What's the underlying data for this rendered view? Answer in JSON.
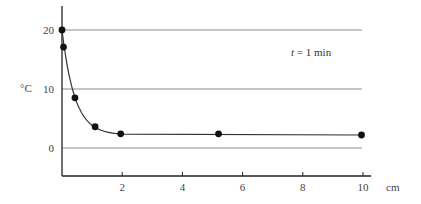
{
  "chart_data": {
    "type": "line",
    "title": "",
    "annotation": "t = 1 min",
    "annotation_italic": "t",
    "annotation_rest": " = 1 min",
    "xlabel": "cm",
    "ylabel": "°C",
    "xlim": [
      0,
      10
    ],
    "ylim": [
      -5,
      24
    ],
    "x_ticks": [
      2,
      4,
      6,
      8,
      10
    ],
    "y_ticks": [
      0,
      10,
      20
    ],
    "grid": "horizontal at y ticks",
    "legend": null,
    "series": [
      {
        "name": "temperature profile",
        "markers": true,
        "points": [
          {
            "x": 0.0,
            "y": 20.0
          },
          {
            "x": 0.05,
            "y": 17.1
          },
          {
            "x": 0.43,
            "y": 8.5
          },
          {
            "x": 1.1,
            "y": 3.6
          },
          {
            "x": 1.95,
            "y": 2.4
          },
          {
            "x": 5.2,
            "y": 2.4
          },
          {
            "x": 9.95,
            "y": 2.2
          }
        ]
      }
    ]
  },
  "colors": {
    "axis": "#222222",
    "grid": "#8a8a8a",
    "curve": "#333333",
    "marker": "#111111"
  }
}
